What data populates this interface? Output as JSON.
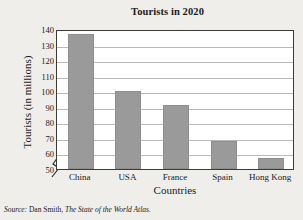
{
  "chart_data": {
    "type": "bar",
    "title": "Tourists in 2020",
    "xlabel": "Countries",
    "ylabel": "Tourists (in millions)",
    "categories": [
      "China",
      "USA",
      "France",
      "Spain",
      "Hong Kong"
    ],
    "values": [
      137,
      100,
      91,
      68,
      57
    ],
    "ylim": [
      50,
      140
    ],
    "yticks": [
      140,
      130,
      120,
      110,
      100,
      90,
      80,
      70,
      60,
      50
    ],
    "axis_break": true,
    "grid": true,
    "legend": "none",
    "bar_color": "#9a9a9a",
    "plot_background": "#ffffff",
    "figure_background": "#efeeea"
  },
  "source": {
    "prefix": "Source:",
    "author": "Dan Smith,",
    "work": "The State of the World Atlas."
  }
}
